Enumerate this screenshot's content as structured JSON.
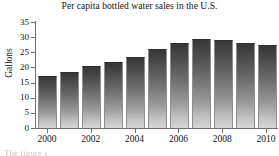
{
  "chart_data": {
    "type": "bar",
    "title": "Per capita bottled water sales in the U.S.",
    "xlabel": "",
    "ylabel": "Gallons",
    "categories": [
      "2000",
      "2001",
      "2002",
      "2003",
      "2004",
      "2005",
      "2006",
      "2007",
      "2008",
      "2009",
      "2010"
    ],
    "values": [
      16.7,
      18.2,
      20.1,
      21.6,
      23.2,
      25.7,
      27.6,
      28.9,
      28.6,
      27.7,
      27.0
    ],
    "ylim": [
      0,
      35
    ],
    "ytick_labels": [
      "0",
      "5",
      "10",
      "15",
      "20",
      "25",
      "30",
      "35"
    ],
    "ytick_values": [
      0,
      5,
      10,
      15,
      20,
      25,
      30,
      35
    ],
    "xtick_labels": [
      "2000",
      "2002",
      "2004",
      "2006",
      "2008",
      "2010"
    ],
    "xtick_values": [
      2000,
      2002,
      2004,
      2006,
      2008,
      2010
    ],
    "grid": false,
    "legend": "none",
    "bar_fill": "#6d6d6d",
    "bar_gradient_top": "#373737",
    "bar_gradient_bottom": "#d6d6d6",
    "axis_color": "#6e6e6e"
  },
  "footer": {
    "clipped_text": "The figure s"
  }
}
